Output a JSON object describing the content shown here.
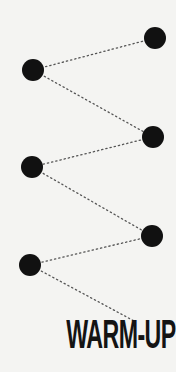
{
  "diagram": {
    "title": "WARM-UP",
    "colors": {
      "background": "#f4f4f2",
      "node": "#111111",
      "connector": "#555555",
      "text": "#141414"
    },
    "nodes": [
      {
        "id": "n1",
        "cx": 155,
        "cy": 38,
        "r": 11
      },
      {
        "id": "n2",
        "cx": 33,
        "cy": 70,
        "r": 11
      },
      {
        "id": "n3",
        "cx": 153,
        "cy": 137,
        "r": 11
      },
      {
        "id": "n4",
        "cx": 32,
        "cy": 167,
        "r": 11
      },
      {
        "id": "n5",
        "cx": 152,
        "cy": 236,
        "r": 11
      },
      {
        "id": "n6",
        "cx": 30,
        "cy": 265,
        "r": 11
      }
    ],
    "connectors": [
      {
        "from": "n1",
        "to": "n2"
      },
      {
        "from": "n2",
        "to": "n3"
      },
      {
        "from": "n3",
        "to": "n4"
      },
      {
        "from": "n4",
        "to": "n5"
      },
      {
        "from": "n5",
        "to": "n6"
      },
      {
        "from": "n6",
        "to": "title",
        "x2": 136,
        "y2": 322
      }
    ]
  }
}
